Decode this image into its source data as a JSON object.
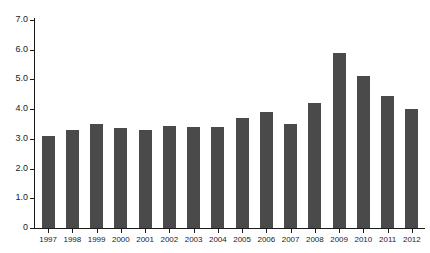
{
  "chart_data": {
    "type": "bar",
    "title": "",
    "subtitle": "",
    "xlabel": "",
    "ylabel": "",
    "categories": [
      "1997",
      "1998",
      "1999",
      "2000",
      "2001",
      "2002",
      "2003",
      "2004",
      "2005",
      "2006",
      "2007",
      "2008",
      "2009",
      "2010",
      "2011",
      "2012"
    ],
    "values": [
      3.1,
      3.3,
      3.5,
      3.35,
      3.3,
      3.45,
      3.4,
      3.4,
      3.7,
      3.9,
      3.5,
      4.2,
      5.9,
      5.1,
      4.45,
      4.0
    ],
    "series": [
      {
        "name": "",
        "values": [
          3.1,
          3.3,
          3.5,
          3.35,
          3.3,
          3.45,
          3.4,
          3.4,
          3.7,
          3.9,
          3.5,
          4.2,
          5.9,
          5.1,
          4.45,
          4.0
        ]
      }
    ],
    "ylim": [
      0,
      7.0
    ],
    "ytick_values": [
      0,
      1.0,
      2.0,
      3.0,
      4.0,
      5.0,
      6.0,
      7.0
    ],
    "ytick_labels": [
      "0",
      "1.0",
      "2.0",
      "3.0",
      "4.0",
      "5.0",
      "6.0",
      "7.0"
    ],
    "grid": false,
    "legend": false,
    "legend_position": "none",
    "bar_color": "#4a4a4a",
    "axis_color": "#1a1a1a",
    "background_color": "#ffffff"
  }
}
